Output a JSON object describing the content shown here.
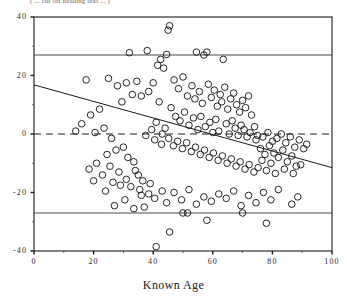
{
  "top_caption": "( ... cut off heading text ... )",
  "axis": {
    "x_title": "Known Age",
    "y_title": "",
    "x_ticks": [
      "0",
      "20",
      "40",
      "60",
      "80",
      "100"
    ],
    "y_ticks": [
      "40",
      "20",
      "0",
      "-20",
      "-40"
    ]
  },
  "chart_data": {
    "type": "scatter",
    "title": "",
    "subtitle": "",
    "xlabel": "Known Age",
    "ylabel": "",
    "xlim": [
      0,
      100
    ],
    "ylim": [
      -40,
      40
    ],
    "grid": false,
    "legend": "none",
    "marker": {
      "shape": "open-circle",
      "size": 4.4,
      "edge_color": "#1a1a1a",
      "fill_color": "none"
    },
    "annotations": [
      {
        "name": "upper-limit-line",
        "type": "hline",
        "y": 27,
        "style": "solid",
        "color": "#4a4a4a"
      },
      {
        "name": "zero-line",
        "type": "hline",
        "y": 0,
        "style": "dashed",
        "color": "#1a1a1a"
      },
      {
        "name": "lower-limit-line",
        "type": "hline",
        "y": -27,
        "style": "solid",
        "color": "#4a4a4a"
      },
      {
        "name": "regression-line",
        "type": "line",
        "style": "solid",
        "color": "#1a1a1a",
        "x": [
          0,
          100
        ],
        "y": [
          16.8,
          -11.5
        ]
      }
    ],
    "points": [
      [
        45.5,
        37.0
      ],
      [
        32.0,
        27.8
      ],
      [
        38.0,
        28.5
      ],
      [
        41.5,
        23.5
      ],
      [
        42.5,
        25.5
      ],
      [
        54.5,
        28.0
      ],
      [
        43.5,
        22.5
      ],
      [
        44.5,
        27.2
      ],
      [
        57.0,
        27.0
      ],
      [
        58.0,
        28.0
      ],
      [
        45.0,
        35.5
      ],
      [
        63.5,
        25.5
      ],
      [
        17.5,
        18.5
      ],
      [
        25.0,
        19.0
      ],
      [
        28.0,
        16.5
      ],
      [
        31.0,
        17.5
      ],
      [
        33.0,
        13.5
      ],
      [
        34.5,
        18.0
      ],
      [
        36.0,
        13.0
      ],
      [
        38.5,
        14.5
      ],
      [
        40.0,
        17.5
      ],
      [
        42.0,
        11.0
      ],
      [
        29.5,
        11.0
      ],
      [
        22.0,
        8.5
      ],
      [
        19.0,
        6.5
      ],
      [
        16.0,
        3.5
      ],
      [
        14.0,
        1.0
      ],
      [
        20.5,
        0.5
      ],
      [
        23.5,
        2.0
      ],
      [
        26.0,
        -1.5
      ],
      [
        27.5,
        -5.5
      ],
      [
        24.5,
        -7.0
      ],
      [
        21.0,
        -10.0
      ],
      [
        18.5,
        -12.0
      ],
      [
        30.0,
        -4.5
      ],
      [
        31.5,
        -8.0
      ],
      [
        33.5,
        -9.5
      ],
      [
        35.0,
        -14.0
      ],
      [
        28.5,
        -13.0
      ],
      [
        26.5,
        -16.5
      ],
      [
        29.0,
        -17.5
      ],
      [
        32.5,
        -18.0
      ],
      [
        36.5,
        -16.0
      ],
      [
        34.0,
        -12.5
      ],
      [
        47.0,
        18.5
      ],
      [
        48.5,
        15.5
      ],
      [
        50.0,
        19.5
      ],
      [
        51.5,
        13.0
      ],
      [
        53.0,
        16.5
      ],
      [
        54.0,
        12.0
      ],
      [
        55.5,
        14.5
      ],
      [
        56.5,
        10.5
      ],
      [
        58.5,
        17.0
      ],
      [
        59.5,
        12.5
      ],
      [
        60.5,
        15.0
      ],
      [
        61.5,
        9.5
      ],
      [
        62.5,
        13.5
      ],
      [
        63.0,
        11.0
      ],
      [
        64.0,
        16.0
      ],
      [
        65.0,
        8.5
      ],
      [
        66.0,
        12.0
      ],
      [
        67.0,
        14.0
      ],
      [
        68.0,
        10.0
      ],
      [
        69.0,
        7.5
      ],
      [
        70.0,
        11.5
      ],
      [
        71.0,
        9.0
      ],
      [
        72.0,
        13.0
      ],
      [
        73.0,
        6.5
      ],
      [
        46.0,
        9.0
      ],
      [
        47.5,
        6.0
      ],
      [
        49.0,
        4.5
      ],
      [
        50.5,
        7.5
      ],
      [
        52.0,
        3.0
      ],
      [
        53.5,
        5.5
      ],
      [
        55.0,
        1.5
      ],
      [
        56.0,
        6.0
      ],
      [
        57.5,
        2.5
      ],
      [
        59.0,
        4.0
      ],
      [
        60.0,
        0.5
      ],
      [
        61.0,
        5.0
      ],
      [
        62.0,
        1.0
      ],
      [
        64.5,
        3.5
      ],
      [
        65.5,
        0.0
      ],
      [
        66.5,
        4.5
      ],
      [
        67.5,
        2.0
      ],
      [
        68.5,
        -0.5
      ],
      [
        69.5,
        3.0
      ],
      [
        70.5,
        1.5
      ],
      [
        71.5,
        -1.0
      ],
      [
        72.5,
        0.5
      ],
      [
        74.0,
        2.5
      ],
      [
        75.0,
        -0.5
      ],
      [
        44.0,
        2.0
      ],
      [
        43.0,
        0.0
      ],
      [
        41.0,
        4.0
      ],
      [
        39.5,
        1.5
      ],
      [
        37.5,
        -0.5
      ],
      [
        40.5,
        -2.0
      ],
      [
        42.8,
        -3.5
      ],
      [
        45.2,
        -1.5
      ],
      [
        46.8,
        -4.0
      ],
      [
        48.2,
        -2.5
      ],
      [
        49.8,
        -5.0
      ],
      [
        51.2,
        -3.0
      ],
      [
        52.8,
        -6.0
      ],
      [
        54.2,
        -4.5
      ],
      [
        55.8,
        -7.0
      ],
      [
        57.2,
        -5.5
      ],
      [
        58.8,
        -8.0
      ],
      [
        60.2,
        -6.5
      ],
      [
        61.8,
        -9.0
      ],
      [
        63.2,
        -7.5
      ],
      [
        64.8,
        -10.0
      ],
      [
        66.2,
        -8.5
      ],
      [
        67.8,
        -11.0
      ],
      [
        69.2,
        -9.5
      ],
      [
        70.8,
        -12.0
      ],
      [
        72.2,
        -10.5
      ],
      [
        73.8,
        -13.0
      ],
      [
        75.2,
        -11.5
      ],
      [
        76.5,
        -9.0
      ],
      [
        78.0,
        -12.5
      ],
      [
        79.5,
        -10.0
      ],
      [
        81.0,
        -13.5
      ],
      [
        76.0,
        -5.0
      ],
      [
        77.5,
        -7.0
      ],
      [
        79.0,
        -4.0
      ],
      [
        80.5,
        -6.5
      ],
      [
        82.0,
        -8.0
      ],
      [
        83.5,
        -5.5
      ],
      [
        85.0,
        -9.5
      ],
      [
        86.5,
        -7.5
      ],
      [
        88.0,
        -11.0
      ],
      [
        84.0,
        -12.0
      ],
      [
        87.0,
        -13.5
      ],
      [
        89.5,
        -10.5
      ],
      [
        74.5,
        -2.0
      ],
      [
        76.8,
        -1.0
      ],
      [
        78.5,
        0.5
      ],
      [
        80.0,
        -2.5
      ],
      [
        81.5,
        -1.5
      ],
      [
        83.0,
        0.0
      ],
      [
        84.5,
        -3.0
      ],
      [
        86.0,
        -1.0
      ],
      [
        87.5,
        -4.5
      ],
      [
        89.0,
        -2.0
      ],
      [
        90.5,
        -5.0
      ],
      [
        91.5,
        -3.5
      ],
      [
        38.5,
        -20.5
      ],
      [
        40.5,
        -22.0
      ],
      [
        43.0,
        -19.5
      ],
      [
        36.0,
        -21.0
      ],
      [
        44.5,
        -23.5
      ],
      [
        47.0,
        -20.0
      ],
      [
        49.5,
        -22.5
      ],
      [
        52.0,
        -19.0
      ],
      [
        54.5,
        -24.0
      ],
      [
        57.0,
        -21.5
      ],
      [
        59.5,
        -23.0
      ],
      [
        62.0,
        -20.5
      ],
      [
        64.5,
        -22.0
      ],
      [
        67.0,
        -19.5
      ],
      [
        69.5,
        -24.5
      ],
      [
        72.0,
        -21.0
      ],
      [
        74.5,
        -23.5
      ],
      [
        77.0,
        -20.0
      ],
      [
        79.5,
        -22.5
      ],
      [
        82.0,
        -19.0
      ],
      [
        50.0,
        -27.0
      ],
      [
        51.5,
        -27.0
      ],
      [
        70.0,
        -27.0
      ],
      [
        45.5,
        -33.5
      ],
      [
        58.0,
        -29.5
      ],
      [
        78.0,
        -30.5
      ],
      [
        86.5,
        -24.0
      ],
      [
        88.5,
        -21.5
      ],
      [
        41.0,
        -38.5
      ],
      [
        33.5,
        -25.5
      ],
      [
        30.5,
        -22.5
      ],
      [
        27.0,
        -24.5
      ],
      [
        24.0,
        -19.5
      ],
      [
        20.0,
        -16.0
      ],
      [
        23.0,
        -14.0
      ],
      [
        25.5,
        -11.0
      ],
      [
        37.0,
        -25.0
      ],
      [
        39.0,
        -17.0
      ],
      [
        35.5,
        -19.0
      ],
      [
        31.0,
        -15.5
      ]
    ]
  }
}
